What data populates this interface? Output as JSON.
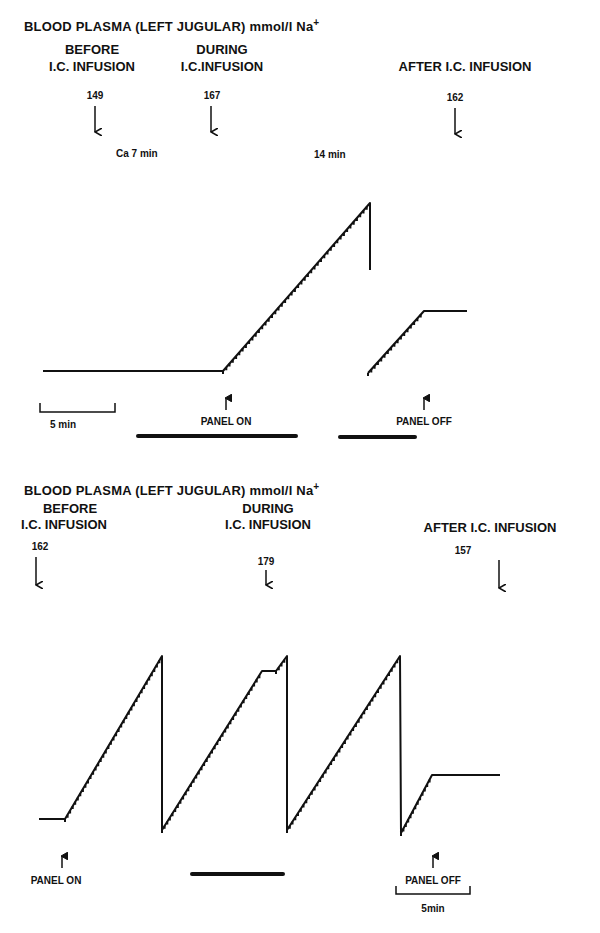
{
  "chart_data": [
    {
      "type": "line",
      "title": "BLOOD PLASMA (LEFT JUGULAR) mmol/l Na+",
      "phases": [
        {
          "label_line1": "BEFORE",
          "label_line2": "I.C. INFUSION",
          "value": 149
        },
        {
          "label_line1": "DURING",
          "label_line2": "I.C.INFUSION",
          "value": 167
        },
        {
          "label_line1": "",
          "label_line2": "AFTER I.C. INFUSION",
          "value": 162
        }
      ],
      "annotations": [
        "Ca 7 min",
        "14 min",
        "PANEL ON",
        "PANEL OFF"
      ],
      "scale_bar": "5 min",
      "xlabel": "",
      "ylabel": "",
      "trace_points": [
        [
          43,
          371
        ],
        [
          223,
          371
        ],
        [
          370,
          203
        ],
        [
          370,
          270
        ],
        [
          368,
          373
        ],
        [
          424,
          311
        ],
        [
          467,
          311
        ]
      ]
    },
    {
      "type": "line",
      "title": "BLOOD PLASMA (LEFT JUGULAR) mmol/l Na+",
      "phases": [
        {
          "label_line1": "BEFORE",
          "label_line2": "I.C. INFUSION",
          "value": 162
        },
        {
          "label_line1": "DURING",
          "label_line2": "I.C. INFUSION",
          "value": 179
        },
        {
          "label_line1": "",
          "label_line2": "AFTER I.C. INFUSION",
          "value": 157
        }
      ],
      "annotations": [
        "PANEL ON",
        "PANEL OFF"
      ],
      "scale_bar": "5min",
      "xlabel": "",
      "ylabel": "",
      "trace_points": [
        [
          39,
          819
        ],
        [
          65,
          819
        ],
        [
          162,
          656
        ],
        [
          162,
          830
        ],
        [
          262,
          671
        ],
        [
          276,
          671
        ],
        [
          287,
          656
        ],
        [
          287,
          830
        ],
        [
          400,
          656
        ],
        [
          401,
          833
        ],
        [
          432,
          775
        ],
        [
          500,
          775
        ]
      ]
    }
  ],
  "top": {
    "title": "BLOOD PLASMA (LEFT JUGULAR) mmol/l  Na",
    "title_sup": "+",
    "before1": "BEFORE",
    "before2": "I.C. INFUSION",
    "during1": "DURING",
    "during2": "I.C.INFUSION",
    "after": "AFTER I.C. INFUSION",
    "v_before": "149",
    "v_during": "167",
    "v_after": "162",
    "ca_note": "Ca  7 min",
    "min_note": "14 min",
    "scale": "5 min",
    "panel_on": "PANEL ON",
    "panel_off": "PANEL OFF"
  },
  "bottom": {
    "title": "BLOOD PLASMA (LEFT JUGULAR) mmol/l  Na",
    "title_sup": "+",
    "before1": "BEFORE",
    "before2": "I.C. INFUSION",
    "during1": "DURING",
    "during2": "I.C. INFUSION",
    "after": "AFTER I.C. INFUSION",
    "v_before": "162",
    "v_during": "179",
    "v_after": "157",
    "scale": "5min",
    "panel_on": "PANEL ON",
    "panel_off": "PANEL OFF"
  }
}
